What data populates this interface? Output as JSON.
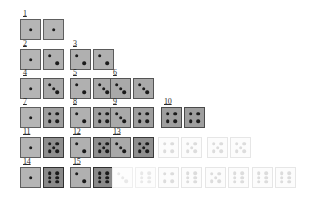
{
  "figure": {
    "background_color": "#ffffff",
    "pip_color": "#1a1a1a",
    "faded_pip_color": "#dcdcdc",
    "die_size_px": 21,
    "rows_count": 6,
    "numbered_pairs_count": 15,
    "total_pairs_shown": 36
  },
  "pip_layout": {
    "1": [
      [
        50,
        50
      ]
    ],
    "2": [
      [
        30,
        30
      ],
      [
        70,
        70
      ]
    ],
    "3": [
      [
        30,
        30
      ],
      [
        50,
        50
      ],
      [
        70,
        70
      ]
    ],
    "4": [
      [
        30,
        30
      ],
      [
        70,
        30
      ],
      [
        30,
        70
      ],
      [
        70,
        70
      ]
    ],
    "5": [
      [
        30,
        30
      ],
      [
        70,
        30
      ],
      [
        50,
        50
      ],
      [
        30,
        70
      ],
      [
        70,
        70
      ]
    ],
    "6": [
      [
        30,
        27
      ],
      [
        70,
        27
      ],
      [
        30,
        50
      ],
      [
        70,
        50
      ],
      [
        30,
        73
      ],
      [
        70,
        73
      ]
    ]
  },
  "rows": [
    {
      "row_index": 1,
      "top": 12,
      "cells": [
        {
          "label": "1",
          "left": 20,
          "dice": [
            1,
            1
          ],
          "faded": false
        }
      ]
    },
    {
      "row_index": 2,
      "top": 42,
      "cells": [
        {
          "label": "2",
          "left": 20,
          "dice": [
            1,
            2
          ],
          "faded": false
        },
        {
          "label": "3",
          "left": 70,
          "dice": [
            2,
            2
          ],
          "faded": false
        }
      ]
    },
    {
      "row_index": 3,
      "top": 71,
      "cells": [
        {
          "label": "4",
          "left": 20,
          "dice": [
            1,
            3
          ],
          "faded": false
        },
        {
          "label": "5",
          "left": 70,
          "dice": [
            2,
            3
          ],
          "faded": false
        },
        {
          "label": "6",
          "left": 110,
          "dice": [
            3,
            3
          ],
          "faded": false
        }
      ]
    },
    {
      "row_index": 4,
      "top": 100,
      "cells": [
        {
          "label": "7",
          "left": 20,
          "dice": [
            1,
            4
          ],
          "faded": false
        },
        {
          "label": "8",
          "left": 70,
          "dice": [
            2,
            4
          ],
          "faded": false
        },
        {
          "label": "9",
          "left": 110,
          "dice": [
            3,
            4
          ],
          "faded": false
        },
        {
          "label": "10",
          "left": 161,
          "dice": [
            4,
            4
          ],
          "faded": false
        }
      ]
    },
    {
      "row_index": 5,
      "top": 130,
      "cells": [
        {
          "label": "11",
          "left": 20,
          "dice": [
            1,
            5
          ],
          "faded": false
        },
        {
          "label": "12",
          "left": 70,
          "dice": [
            2,
            5
          ],
          "faded": false
        },
        {
          "label": "13",
          "left": 110,
          "dice": [
            3,
            5
          ],
          "faded": false
        },
        {
          "label": "",
          "left": 158,
          "dice": [
            4,
            5
          ],
          "faded": true
        },
        {
          "label": "",
          "left": 207,
          "dice": [
            5,
            5
          ],
          "faded": true
        }
      ]
    },
    {
      "row_index": 6,
      "top": 160,
      "cells": [
        {
          "label": "14",
          "left": 20,
          "dice": [
            1,
            6
          ],
          "faded": false
        },
        {
          "label": "15",
          "left": 70,
          "dice": [
            2,
            6
          ],
          "faded": false
        },
        {
          "label": "",
          "left": 112,
          "dice": [
            3,
            6
          ],
          "faded": true,
          "extra_fade": true
        },
        {
          "label": "",
          "left": 158,
          "dice": [
            4,
            6
          ],
          "faded": true
        },
        {
          "label": "",
          "left": 205,
          "dice": [
            5,
            6
          ],
          "faded": true
        },
        {
          "label": "",
          "left": 252,
          "dice": [
            6,
            6
          ],
          "faded": true
        }
      ]
    }
  ]
}
